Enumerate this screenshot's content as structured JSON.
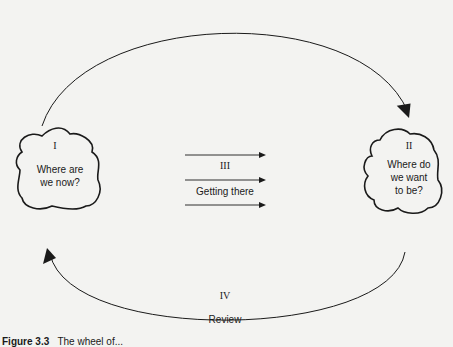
{
  "diagram": {
    "nodes": [
      {
        "id": "I",
        "numeral": "I",
        "label": "Where are we now?"
      },
      {
        "id": "II",
        "numeral": "II",
        "label": "Where do we want to be?"
      }
    ],
    "transition": {
      "numeral": "III",
      "label": "Getting there"
    },
    "feedback": {
      "numeral": "IV",
      "label": "Review"
    }
  },
  "text": {
    "node1_numeral": "I",
    "node1_line1": "Where are",
    "node1_line2": "we now?",
    "node2_numeral": "II",
    "node2_line1": "Where do",
    "node2_line2": "we want",
    "node2_line3": "to be?",
    "transition_numeral": "III",
    "transition_label": "Getting there",
    "review_numeral": "IV",
    "review_label": "Review",
    "caption_label": "Figure 3.3",
    "caption_text": "The wheel of..."
  },
  "colors": {
    "stroke": "#1a1a1a",
    "background": "#f3f3f1"
  }
}
